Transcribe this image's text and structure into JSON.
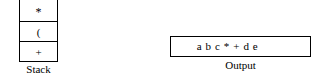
{
  "diagram": {
    "stack": {
      "label": "Stack",
      "cells": [
        {
          "value": "*",
          "position": "top"
        },
        {
          "value": "(",
          "position": "middle"
        },
        {
          "value": "+",
          "position": "bottom"
        }
      ]
    },
    "output": {
      "label": "Output",
      "value": "a b c * + d e"
    },
    "colors": {
      "line": "#000000",
      "text": "#000000",
      "background": "#ffffff"
    }
  }
}
